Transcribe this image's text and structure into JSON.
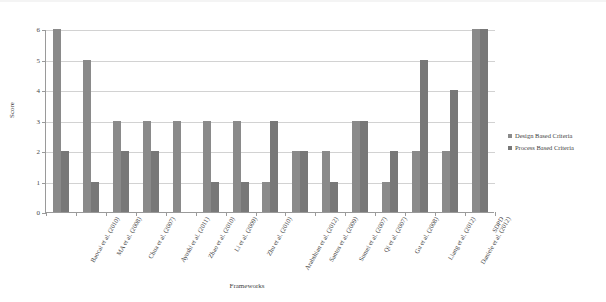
{
  "chart_data": {
    "type": "bar",
    "title": "",
    "xlabel": "Frameworks",
    "ylabel": "Score",
    "ylim": [
      0,
      6
    ],
    "y_ticks": [
      0,
      1,
      2,
      3,
      4,
      5,
      6
    ],
    "grid": true,
    "legend_position": "right",
    "categories": [
      "Baocai et al. (2010)",
      "MA et al. (2008)",
      "Chua et al. (2007)",
      "Ayushi et al. (2011)",
      "Zhao et al. (2010)",
      "Li et al. (2009)",
      "Zhu et al. (2010)",
      "Arabshian et al. (2012)",
      "Santos et al. (2009)",
      "Sumei et al. (2007)",
      "Qi et al. (2007)",
      "Gu et al. (2008)",
      "Liang et al. (2012)",
      "Daniele et al. (2012)",
      "SDPD"
    ],
    "series": [
      {
        "name": "Design Based Criteria",
        "color": "#8a8a8a",
        "values": [
          6,
          5,
          3,
          3,
          3,
          3,
          3,
          1,
          2,
          2,
          3,
          1,
          2,
          2,
          6
        ]
      },
      {
        "name": "Process Based Criteria",
        "color": "#787878",
        "values": [
          2,
          1,
          2,
          2,
          0,
          1,
          1,
          3,
          2,
          1,
          3,
          2,
          5,
          4,
          6
        ]
      }
    ]
  },
  "legend": {
    "items": [
      {
        "label": "Design Based Criteria",
        "color": "#8a8a8a"
      },
      {
        "label": "Process Based Criteria",
        "color": "#787878"
      }
    ]
  },
  "axes": {
    "y_title": "Score",
    "x_title": "Frameworks",
    "y_tick_labels": [
      "0",
      "1",
      "2",
      "3",
      "4",
      "5",
      "6"
    ]
  },
  "colors": {
    "series_design": "#8a8a8a",
    "series_process": "#787878",
    "gridline": "#d2d2d2",
    "axis": "#9a9a9a",
    "text": "#3f3f3f",
    "background": "#ffffff"
  }
}
